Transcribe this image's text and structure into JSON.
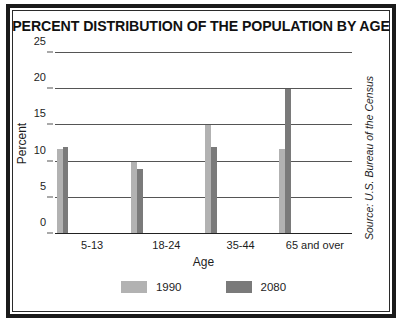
{
  "figure": {
    "title": "PERCENT DISTRIBUTION OF THE POPULATION BY AGE",
    "source": "Source: U.S. Bureau of the Census"
  },
  "chart_data": {
    "type": "bar",
    "title": "PERCENT DISTRIBUTION OF THE POPULATION BY AGE",
    "xlabel": "Age",
    "ylabel": "Percent",
    "categories": [
      "5-13",
      "18-24",
      "35-44",
      "65 and over"
    ],
    "series": [
      {
        "name": "1990",
        "color": "#b2b2b2",
        "values": [
          11.7,
          10,
          15,
          11.7
        ]
      },
      {
        "name": "2080",
        "color": "#7a7a7a",
        "values": [
          12,
          9,
          12,
          20
        ]
      }
    ],
    "ylim": [
      0,
      25
    ],
    "yticks": [
      0,
      5,
      10,
      15,
      20,
      25
    ],
    "ytick_labels": [
      "0",
      "5",
      "10",
      "15",
      "20",
      "25"
    ],
    "grid": true,
    "legend_position": "bottom",
    "annotations": [
      "Source: U.S. Bureau of the Census"
    ]
  }
}
